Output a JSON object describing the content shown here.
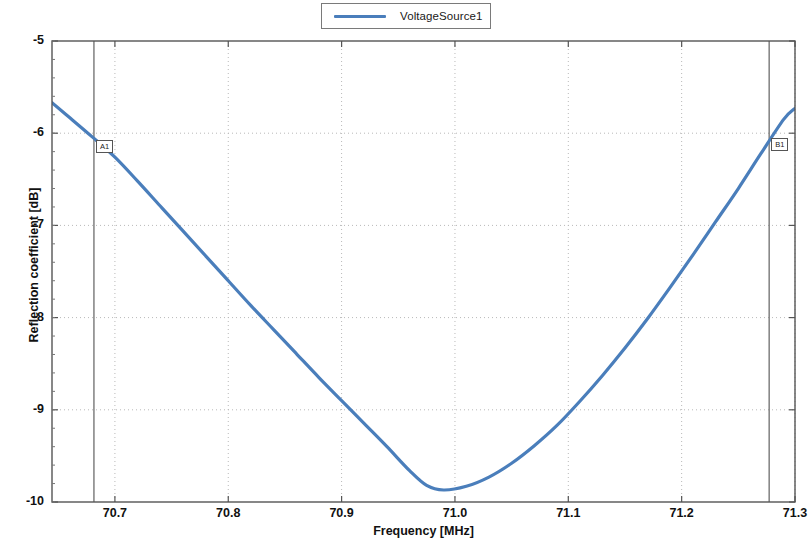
{
  "legend": {
    "entries": [
      {
        "label": "VoltageSource1",
        "color": "#4a7ebb"
      }
    ]
  },
  "axes": {
    "x": {
      "title": "Frequency [MHz]",
      "ticks": [
        "70.7",
        "70.8",
        "70.9",
        "71.0",
        "71.1",
        "71.2",
        "71.3"
      ],
      "min": 70.6445,
      "max": 71.3
    },
    "y": {
      "title": "Reflection coefficient [dB]",
      "ticks": [
        "-5",
        "-6",
        "-7",
        "-8",
        "-9",
        "-10"
      ],
      "min": -10,
      "max": -5
    }
  },
  "markers": [
    {
      "name": "A1",
      "x": 70.6815,
      "y": -6.02
    },
    {
      "name": "B1",
      "x": 71.2772,
      "y": -6.0
    }
  ],
  "chart_data": {
    "type": "line",
    "title": "",
    "xlabel": "Frequency [MHz]",
    "ylabel": "Reflection coefficient [dB]",
    "xlim": [
      70.6445,
      71.3
    ],
    "ylim": [
      -10,
      -5
    ],
    "grid": true,
    "legend_position": "top-center",
    "series": [
      {
        "name": "VoltageSource1",
        "color": "#4a7ebb",
        "x": [
          70.6445,
          70.66,
          70.68,
          70.7,
          70.72,
          70.74,
          70.76,
          70.78,
          70.8,
          70.82,
          70.84,
          70.86,
          70.88,
          70.9,
          70.92,
          70.94,
          70.96,
          70.975,
          70.99,
          71.01,
          71.03,
          71.05,
          71.07,
          71.09,
          71.11,
          71.13,
          71.15,
          71.17,
          71.19,
          71.21,
          71.23,
          71.25,
          71.27,
          71.29,
          71.3
        ],
        "y": [
          -5.67,
          -5.83,
          -6.04,
          -6.26,
          -6.52,
          -6.79,
          -7.06,
          -7.33,
          -7.6,
          -7.87,
          -8.13,
          -8.39,
          -8.65,
          -8.9,
          -9.15,
          -9.4,
          -9.66,
          -9.82,
          -9.87,
          -9.83,
          -9.73,
          -9.58,
          -9.39,
          -9.17,
          -8.91,
          -8.63,
          -8.33,
          -8.01,
          -7.67,
          -7.32,
          -6.96,
          -6.6,
          -6.22,
          -5.85,
          -5.73
        ]
      }
    ],
    "annotations": [
      {
        "label": "A1",
        "x": 70.6815,
        "type": "vertical-cursor"
      },
      {
        "label": "B1",
        "x": 71.2772,
        "type": "vertical-cursor"
      }
    ],
    "minimum": {
      "x": 70.99,
      "y": -9.87
    }
  }
}
